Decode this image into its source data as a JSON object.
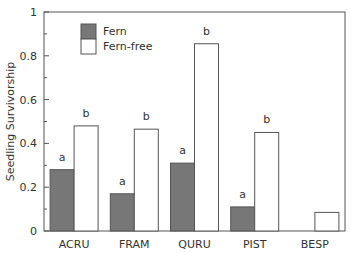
{
  "chart_data": {
    "type": "bar",
    "title": "",
    "xlabel": "",
    "ylabel": "Seedling Survivorship",
    "ylim": [
      0,
      1
    ],
    "yticks": [
      0,
      0.2,
      0.4,
      0.6,
      0.8,
      1
    ],
    "ytick_labels": [
      "0",
      "0.2",
      "0.4",
      "0.6",
      "0.8",
      "1"
    ],
    "categories": [
      "ACRU",
      "FRAM",
      "QURU",
      "PIST",
      "BESP"
    ],
    "series": [
      {
        "name": "Fern",
        "color": "#777777",
        "values": [
          0.28,
          0.17,
          0.31,
          0.11,
          0
        ],
        "letters": [
          "a",
          "a",
          "a",
          "a",
          ""
        ]
      },
      {
        "name": "Fern-free",
        "color": "#ffffff",
        "values": [
          0.48,
          0.465,
          0.855,
          0.45,
          0.085
        ],
        "letters": [
          "b",
          "b",
          "b",
          "b",
          ""
        ]
      }
    ],
    "legend_position": "upper-left-inside",
    "grid": false
  },
  "legend": {
    "items": [
      "Fern",
      "Fern-free"
    ]
  },
  "axis": {
    "ylabel": "Seedling Survivorship"
  }
}
